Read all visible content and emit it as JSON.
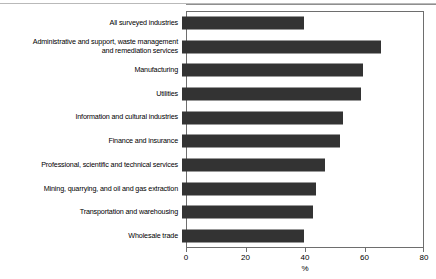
{
  "chart_data": {
    "type": "bar",
    "orientation": "horizontal",
    "title": "",
    "xlabel": "%",
    "ylabel": "",
    "xlim": [
      0,
      80
    ],
    "xticks": [
      0,
      20,
      40,
      60,
      80
    ],
    "xtick_labels": [
      "0",
      "20",
      "40",
      "60",
      "80"
    ],
    "grid": false,
    "legend": null,
    "bar_color": "#333333",
    "frame_color": "#6e6e6e",
    "categories": [
      "All surveyed industries",
      "Administrative and support, waste management\nand remediation services",
      "Manufacturing",
      "Utilities",
      "Information and cultural industries",
      "Finance and insurance",
      "Professional, scientific and technical services",
      "Mining, quarrying, and oil and gas extraction",
      "Transportation and warehousing",
      "Wholesale trade"
    ],
    "values": [
      41,
      67,
      61,
      60,
      54,
      53,
      48,
      45,
      44,
      41
    ]
  },
  "axis": {
    "x_title": "%"
  }
}
